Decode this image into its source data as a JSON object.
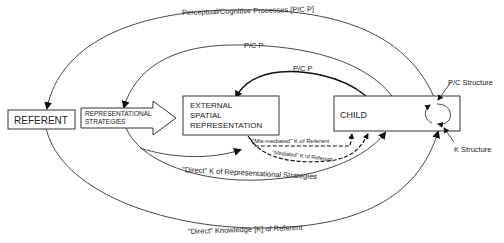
{
  "boxes": {
    "referent": "REFERENT",
    "strategies_line1": "REPRESENTATIONAL",
    "strategies_line2": "STRATEGIES",
    "external_line1": "EXTERNAL",
    "external_line2": "SPATIAL",
    "external_line3": "REPRESENTATION",
    "child": "CHILD"
  },
  "labels": {
    "outer_top": "Perceptual/Cognitive Processes [P/C P]",
    "middle_top": "P/C P",
    "inner_top": "P/C P",
    "pc_structure": "P/C Structure",
    "k_structure": "K Structure",
    "mis_mediated": "\"Mis-mediated\" K of Referent",
    "mediated": "\"Mediated\" K of Referent",
    "direct_strategies": "\"Direct\" K of Representational Strategies",
    "direct_referent": "\"Direct\" Knowledge [K] of Referent"
  }
}
